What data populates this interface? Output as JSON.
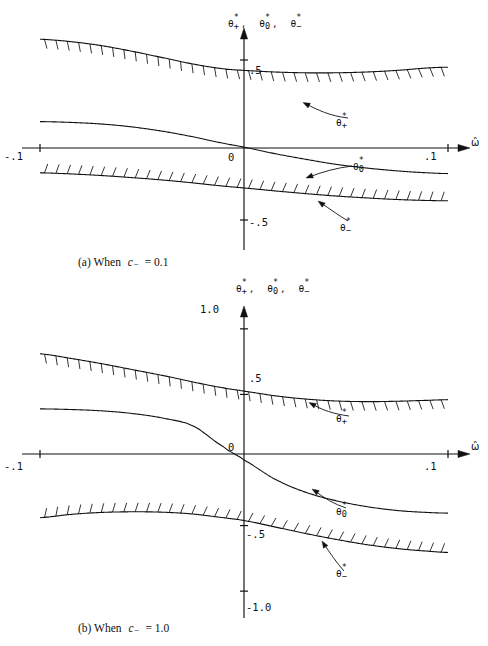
{
  "figure": {
    "type": "two-panel line chart",
    "background": "#ffffff",
    "ink": "#111111"
  },
  "panels": [
    {
      "id": "a",
      "caption": "(a) When",
      "caption_var": "c",
      "caption_sub": "−",
      "caption_eq": "= 0.1",
      "caption_full": "(a) When c− = 0.1",
      "y_axis_label_parts": [
        "θ*+",
        "θ*0",
        "θ*−"
      ],
      "x_axis_label": "ω̂",
      "x_ticks": [
        "-.1",
        ".1"
      ],
      "x_tick_values": [
        -0.1,
        0.1
      ],
      "y_ticks": [
        ".5",
        "0",
        "-.5"
      ],
      "y_tick_values": [
        0.5,
        0.0,
        -0.5
      ],
      "zero_label": "0",
      "curve_labels": [
        "θ*+",
        "θ*0",
        "θ*−"
      ]
    },
    {
      "id": "b",
      "caption": "(b) When",
      "caption_var": "c",
      "caption_sub": "−",
      "caption_eq": "= 1.0",
      "caption_full": "(b) When c− = 1.0",
      "y_axis_label_parts": [
        "θ*+",
        "θ*0",
        "θ*−"
      ],
      "x_axis_label": "ω̂",
      "x_ticks": [
        "-.1",
        ".1"
      ],
      "x_tick_values": [
        -0.1,
        0.1
      ],
      "y_ticks": [
        "1.0",
        ".5",
        "0",
        "-.5",
        "-1.0"
      ],
      "y_tick_values": [
        1.0,
        0.5,
        0.0,
        -0.5,
        -1.0
      ],
      "zero_label": "0",
      "curve_labels": [
        "θ*+",
        "θ*0",
        "θ*−"
      ]
    }
  ],
  "chart_data": [
    {
      "type": "line",
      "id": "panel-a",
      "title": "(a) When c− = 0.1",
      "xlabel": "ω̂",
      "ylabel": "θ*+, θ*0, θ*−",
      "xlim": [
        -0.1,
        0.1
      ],
      "ylim": [
        -0.75,
        0.75
      ],
      "xticks": [
        -0.1,
        0.1
      ],
      "xticklabels": [
        "-.1",
        ".1"
      ],
      "yticks": [
        0.5,
        0.0,
        -0.5
      ],
      "yticklabels": [
        ".5",
        "0",
        "-.5"
      ],
      "grid": false,
      "legend": "inline-annotations",
      "x": [
        -0.1,
        -0.085,
        -0.07,
        -0.055,
        -0.04,
        -0.025,
        -0.01,
        0.0,
        0.015,
        0.03,
        0.045,
        0.06,
        0.075,
        0.09,
        0.1
      ],
      "series": [
        {
          "name": "θ*+",
          "hatched": true,
          "hatch_side": "below",
          "values": [
            0.63,
            0.615,
            0.59,
            0.555,
            0.515,
            0.475,
            0.445,
            0.435,
            0.425,
            0.42,
            0.42,
            0.425,
            0.435,
            0.45,
            0.455
          ]
        },
        {
          "name": "θ*0",
          "hatched": false,
          "values": [
            0.115,
            0.11,
            0.1,
            0.082,
            0.055,
            0.02,
            -0.02,
            -0.045,
            -0.085,
            -0.12,
            -0.152,
            -0.175,
            -0.193,
            -0.205,
            -0.21
          ]
        },
        {
          "name": "θ*−",
          "hatched": true,
          "hatch_side": "above",
          "values": [
            -0.205,
            -0.212,
            -0.222,
            -0.235,
            -0.25,
            -0.268,
            -0.288,
            -0.3,
            -0.318,
            -0.335,
            -0.35,
            -0.362,
            -0.372,
            -0.378,
            -0.38
          ]
        }
      ]
    },
    {
      "type": "line",
      "id": "panel-b",
      "title": "(b) When c− = 1.0",
      "xlabel": "ω̂",
      "ylabel": "θ*+, θ*0, θ*−",
      "xlim": [
        -0.1,
        0.1
      ],
      "ylim": [
        -1.15,
        1.15
      ],
      "xticks": [
        -0.1,
        0.1
      ],
      "xticklabels": [
        "-.1",
        ".1"
      ],
      "yticks": [
        1.0,
        0.5,
        0.0,
        -0.5,
        -1.0
      ],
      "yticklabels": [
        "1.0",
        ".5",
        "0",
        "-.5",
        "-1.0"
      ],
      "grid": false,
      "legend": "inline-annotations",
      "x": [
        -0.1,
        -0.085,
        -0.07,
        -0.055,
        -0.04,
        -0.025,
        -0.01,
        0.0,
        0.015,
        0.03,
        0.045,
        0.06,
        0.075,
        0.09,
        0.1
      ],
      "series": [
        {
          "name": "θ*+",
          "hatched": true,
          "hatch_side": "below",
          "values": [
            0.81,
            0.775,
            0.735,
            0.69,
            0.645,
            0.595,
            0.55,
            0.525,
            0.49,
            0.465,
            0.45,
            0.445,
            0.448,
            0.455,
            0.46
          ]
        },
        {
          "name": "θ*0",
          "hatched": false,
          "values": [
            0.39,
            0.385,
            0.375,
            0.355,
            0.32,
            0.26,
            0.1,
            0.0,
            -0.145,
            -0.245,
            -0.31,
            -0.355,
            -0.385,
            -0.4,
            -0.405
          ]
        },
        {
          "name": "θ*−",
          "hatched": true,
          "hatch_side": "above",
          "values": [
            -0.44,
            -0.415,
            -0.4,
            -0.395,
            -0.398,
            -0.412,
            -0.44,
            -0.462,
            -0.51,
            -0.56,
            -0.605,
            -0.645,
            -0.675,
            -0.695,
            -0.705
          ]
        }
      ]
    }
  ]
}
